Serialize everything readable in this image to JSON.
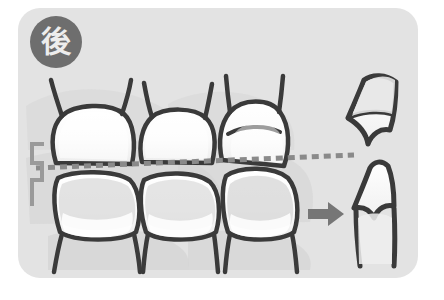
{
  "card": {
    "background_color": "#e3e3e3",
    "corner_radius_px": 22
  },
  "badge": {
    "label": "後",
    "meaning": "after",
    "circle_color": "#6e6e6e",
    "text_color": "#ededed"
  },
  "illustration": {
    "title": "after-treatment tooth alignment diagram",
    "style": "grayscale line drawing",
    "outline_color": "#3a3a3a",
    "tooth_fill_color": "#fdfdfd",
    "shadow_color": "#cfcfcf",
    "gum_color": "#d8d8d8",
    "front_view": {
      "name": "frontal molar arches",
      "upper_teeth_count": 3,
      "lower_teeth_count": 3
    },
    "occlusal_line": {
      "name": "occlusal plane guide",
      "style": "dashed",
      "color": "#8a8a8a",
      "dash_length_px": 7,
      "gap_length_px": 5,
      "thickness_px": 5
    },
    "bracket": {
      "name": "height measurement bracket",
      "color": "#9a9a9a",
      "thickness_px": 4
    },
    "arrow": {
      "name": "points to side profile view",
      "direction": "right",
      "color": "#767676"
    },
    "profile_view": {
      "name": "side cross-section of occlusion",
      "upper_tooth": "upper molar profile",
      "lower_tooth": "lower molar profile"
    }
  }
}
